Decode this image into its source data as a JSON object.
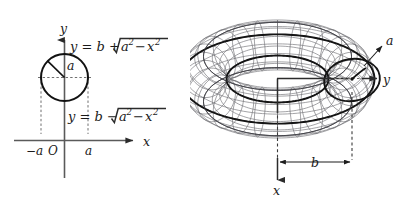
{
  "figure": {
    "background_color": "#ffffff"
  },
  "left_panel": {
    "name": "cross-section-circle-diagram",
    "axes": {
      "x_label": "x",
      "y_label": "y",
      "origin_label": "O"
    },
    "tick_labels": {
      "left": "−a",
      "right": "a"
    },
    "radius_label": "a",
    "equations": {
      "upper": "y = b +",
      "upper_radical_inner": "a² − x²",
      "lower": "y = b −",
      "lower_radical_inner": "a² − x²",
      "upper_full": "y = b + √(a² − x²)",
      "lower_full": "y = b − √(a² − x²)"
    },
    "equation_parts": {
      "y": "y",
      "equals": "=",
      "b": "b",
      "plus": "+",
      "minus": "−",
      "a": "a",
      "x": "x",
      "exp_two": "2",
      "sub_minus": "−"
    }
  },
  "right_panel": {
    "name": "torus-3d-diagram",
    "axes": {
      "x_label": "x",
      "y_label": "y"
    },
    "tube_radius_label": "a",
    "center_radius_label": "b"
  },
  "colors": {
    "ink": "#111111",
    "axis_gray": "#5a5a5a",
    "mesh_gray": "#6b6b70",
    "mesh_dark": "#3f3f44",
    "dash_gray": "#6e6e6e",
    "background": "#ffffff"
  }
}
